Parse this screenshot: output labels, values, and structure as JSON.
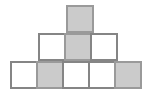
{
  "figure": {
    "shape_type": "staircase-pyramid",
    "unit_square_px": 28,
    "border_color": "#858585",
    "shaded_border_color": "#9a9a9a",
    "shaded_fill_color": "#cbcbcb",
    "unshaded_fill_color": "#ffffff",
    "background_color": "#ffffff",
    "total_squares": 9,
    "shaded_count": 4,
    "unshaded_count": 5,
    "rows": [
      {
        "name": "top-row",
        "row_index": 0,
        "square_count": 1,
        "top_px": 5,
        "left_px": 66,
        "cells": [
          {
            "label": "top-1",
            "shaded": true,
            "fill": "#cbcbcb",
            "col": 0
          }
        ]
      },
      {
        "name": "middle-row",
        "row_index": 1,
        "square_count": 3,
        "top_px": 33,
        "left_px": 38,
        "cells": [
          {
            "label": "middle-1",
            "shaded": false,
            "fill": "#ffffff",
            "col": 0
          },
          {
            "label": "middle-2",
            "shaded": true,
            "fill": "#cbcbcb",
            "col": 1
          },
          {
            "label": "middle-3",
            "shaded": false,
            "fill": "#ffffff",
            "col": 2
          }
        ]
      },
      {
        "name": "bottom-row",
        "row_index": 2,
        "square_count": 5,
        "top_px": 61,
        "left_px": 10,
        "cells": [
          {
            "label": "bottom-1",
            "shaded": false,
            "fill": "#ffffff",
            "col": 0
          },
          {
            "label": "bottom-2",
            "shaded": true,
            "fill": "#cbcbcb",
            "col": 1
          },
          {
            "label": "bottom-3",
            "shaded": false,
            "fill": "#ffffff",
            "col": 2
          },
          {
            "label": "bottom-4",
            "shaded": false,
            "fill": "#ffffff",
            "col": 3
          },
          {
            "label": "bottom-5",
            "shaded": true,
            "fill": "#cbcbcb",
            "col": 4
          }
        ]
      }
    ]
  }
}
